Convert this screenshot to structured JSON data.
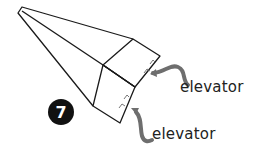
{
  "diagram": {
    "step_number": "7",
    "labels": [
      {
        "text": "elevator",
        "target": "upper-wing"
      },
      {
        "text": "elevator",
        "target": "lower-wing"
      }
    ],
    "colors": {
      "outline": "#1a1a1a",
      "arrow": "#6e6e6e",
      "badge": "#111111",
      "cut_marks": "#777777"
    }
  }
}
